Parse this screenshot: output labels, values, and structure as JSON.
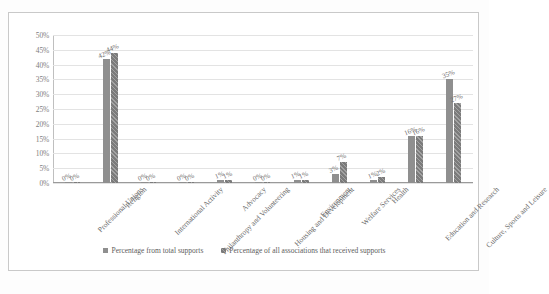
{
  "chart_data": {
    "type": "bar",
    "title": "",
    "xlabel": "",
    "ylabel": "",
    "ylim": [
      0,
      50
    ],
    "yticks": [
      "0%",
      "5%",
      "10%",
      "15%",
      "20%",
      "25%",
      "30%",
      "35%",
      "40%",
      "45%",
      "50%"
    ],
    "ytick_values": [
      0,
      5,
      10,
      15,
      20,
      25,
      30,
      35,
      40,
      45,
      50
    ],
    "grid": true,
    "legend_position": "bottom",
    "categories": [
      "Professional Unions",
      "Religion",
      "International Activity",
      "Philanthropy and Volunteering",
      "Advocacy",
      "Housing and Development",
      "Environment",
      "Welfare Services",
      "Health",
      "Education and Research",
      "Culture, Sports and Leisure"
    ],
    "series": [
      {
        "name": "Percentage from total supports",
        "color": "#8f8f8f",
        "values": [
          0,
          42,
          0,
          0,
          1,
          0,
          1,
          3,
          1,
          16,
          35
        ],
        "labels": [
          "0%",
          "42%",
          "0%",
          "0%",
          "1%",
          "0%",
          "1%",
          "3%",
          "1%",
          "16%",
          "35%"
        ]
      },
      {
        "name": "Percentage of all associations that received supports",
        "color": "#7b7b7b",
        "values": [
          0,
          44,
          0,
          0,
          1,
          0,
          1,
          7,
          2,
          16,
          27
        ],
        "labels": [
          "0%",
          "44%",
          "0%",
          "0%",
          "1%",
          "0%",
          "1%",
          "7%",
          "2%",
          "16%",
          "27%"
        ]
      }
    ]
  },
  "caption": {
    "text": ""
  }
}
